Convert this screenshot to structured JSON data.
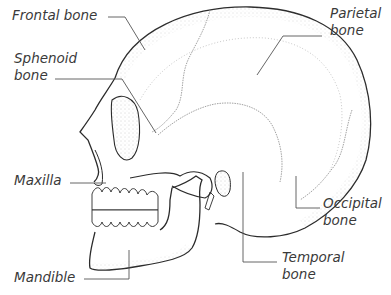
{
  "diagram": {
    "labels": {
      "frontal": "Frontal bone",
      "parietal_1": "Parietal",
      "parietal_2": "bone",
      "sphenoid_1": "Sphenoid",
      "sphenoid_2": "bone",
      "maxilla": "Maxilla",
      "occipital_1": "Occipital",
      "occipital_2": "bone",
      "temporal_1": "Temporal",
      "temporal_2": "bone",
      "mandible": "Mandible"
    },
    "colors": {
      "line": "#2b2b2b",
      "leader": "#555555",
      "text": "#3a3a3a",
      "stipple": "#9a9a9a",
      "background": "#ffffff"
    }
  }
}
